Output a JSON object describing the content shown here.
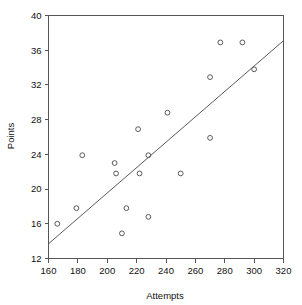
{
  "chart_data": {
    "type": "scatter",
    "title": "",
    "xlabel": "Attempts",
    "ylabel": "Points",
    "xlim": [
      160,
      320
    ],
    "ylim": [
      12,
      40
    ],
    "xticks": [
      160,
      180,
      200,
      220,
      240,
      260,
      280,
      300,
      320
    ],
    "yticks": [
      12,
      16,
      20,
      24,
      28,
      32,
      36,
      40
    ],
    "grid": false,
    "legend": null,
    "marker": "open-circle",
    "series": [
      {
        "name": "observations",
        "points": [
          {
            "x": 166,
            "y": 16.0
          },
          {
            "x": 179,
            "y": 17.8
          },
          {
            "x": 183,
            "y": 23.9
          },
          {
            "x": 205,
            "y": 23.0
          },
          {
            "x": 206,
            "y": 21.8
          },
          {
            "x": 210,
            "y": 14.9
          },
          {
            "x": 213,
            "y": 17.8
          },
          {
            "x": 221,
            "y": 26.9
          },
          {
            "x": 222,
            "y": 21.8
          },
          {
            "x": 228,
            "y": 16.8
          },
          {
            "x": 228,
            "y": 23.9
          },
          {
            "x": 241,
            "y": 28.8
          },
          {
            "x": 250,
            "y": 21.8
          },
          {
            "x": 270,
            "y": 25.9
          },
          {
            "x": 270,
            "y": 32.9
          },
          {
            "x": 277,
            "y": 36.9
          },
          {
            "x": 292,
            "y": 36.9
          },
          {
            "x": 300,
            "y": 33.8
          }
        ]
      }
    ],
    "fit_line": {
      "name": "regression-line",
      "x0": 160,
      "y0": 13.7,
      "x1": 320,
      "y1": 37.1
    }
  }
}
